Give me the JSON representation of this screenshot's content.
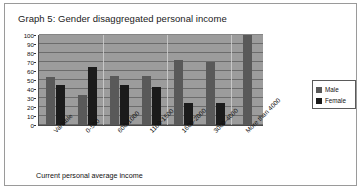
{
  "chart_data": {
    "type": "bar",
    "title": "Graph 5: Gender disaggregated personal income",
    "xlabel": "Current personal average income",
    "ylabel": "",
    "ylim": [
      0,
      100
    ],
    "yticks": [
      100,
      90,
      80,
      70,
      60,
      50,
      40,
      30,
      20,
      10,
      0
    ],
    "grid": true,
    "legend_position": "right",
    "categories": [
      "Variable",
      "0-500",
      "600-1000",
      "1100-1500",
      "1600-2000",
      "3000-4000",
      "More than 4000"
    ],
    "series": [
      {
        "name": "Male",
        "color": "#595959",
        "values": [
          53,
          33,
          55,
          55,
          72,
          70,
          100
        ]
      },
      {
        "name": "Female",
        "color": "#1b1b1b",
        "values": [
          44,
          65,
          45,
          42,
          25,
          25,
          0
        ]
      }
    ]
  },
  "legend": {
    "items": [
      {
        "label": "Male",
        "color": "#595959"
      },
      {
        "label": "Female",
        "color": "#1b1b1b"
      }
    ]
  },
  "colors": {
    "plot_background": "#9c9c9c",
    "gridline": "#5c5c5c",
    "axis": "#4a4a4a",
    "frame_border": "#9a9a9a",
    "page_background": "#ffffff",
    "text": "#111111"
  }
}
